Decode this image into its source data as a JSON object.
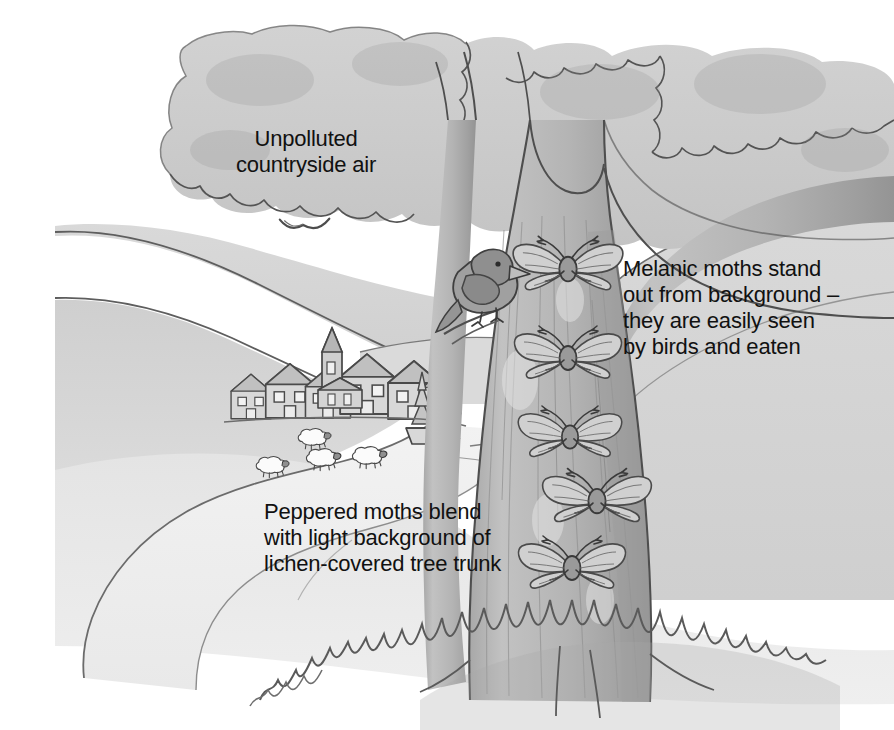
{
  "figure": {
    "title_cut_off": "peppered moth",
    "caption_labels": {
      "air": "Unpolluted\ncountryside air",
      "melanic": "Melanic moths stand\nout from background –\nthey are easily seen\nby birds and eaten",
      "peppered": "Peppered moths blend\nwith light background of\nlichen-covered tree trunk"
    },
    "scene_elements": {
      "tree": "lichen-covered tree trunk with canopy",
      "bird": "bird perched on branch stub",
      "moths": [
        "moth-1",
        "moth-2",
        "moth-3",
        "moth-4",
        "moth-5"
      ],
      "village": "countryside village with houses and church",
      "sheep": [
        "sheep-1",
        "sheep-2",
        "sheep-3",
        "sheep-4"
      ],
      "flying_birds": [
        "flying-bird-1",
        "flying-bird-2"
      ],
      "hills": "rolling hills",
      "path": "winding country path",
      "grass": "grass tufts at base of trunk"
    },
    "colors": {
      "paper": "#ffffff",
      "ink": "#555555",
      "ink_dark": "#3a3a3a",
      "canopy": "#c9c9c9",
      "trunk": "#b9b9b9",
      "trunk_shadow": "#a5a5a5",
      "hill_far": "#d6d6d6",
      "hill_near": "#c6c6c6",
      "ground": "#e2e2e2",
      "text": "#111111"
    }
  }
}
